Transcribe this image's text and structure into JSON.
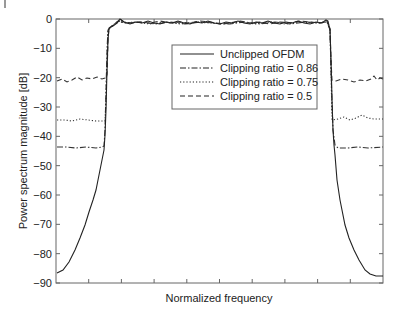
{
  "chart_data": {
    "type": "line",
    "title": "",
    "xlabel": "Normalized frequency",
    "ylabel": "Power spectrum magnitude [dB]",
    "ylim": [
      -90,
      0
    ],
    "xlim": [
      0,
      1
    ],
    "yticks": [
      0,
      -10,
      -20,
      -30,
      -40,
      -50,
      -60,
      -70,
      -80,
      -90
    ],
    "ytick_labels": [
      "0",
      "−10",
      "−20",
      "−30",
      "−40",
      "−50",
      "−60",
      "−70",
      "−80",
      "−90"
    ],
    "xticks": [
      0.1,
      0.2,
      0.3,
      0.4,
      0.5,
      0.6,
      0.7,
      0.8,
      0.9
    ],
    "xtick_labels_visible": false,
    "grid": false,
    "legend_position": "upper center",
    "series": [
      {
        "name": "Unclipped OFDM",
        "style": "solid",
        "points": [
          [
            0.0,
            -86.5
          ],
          [
            0.02,
            -85.5
          ],
          [
            0.05,
            -79
          ],
          [
            0.09,
            -70
          ],
          [
            0.11,
            -61.5
          ],
          [
            0.13,
            -55
          ],
          [
            0.14,
            -48
          ],
          [
            0.145,
            -45
          ],
          [
            0.155,
            -30
          ],
          [
            0.16,
            -10
          ],
          [
            0.163,
            -3
          ],
          [
            0.17,
            -2.5
          ],
          [
            0.19,
            -1
          ],
          [
            0.2,
            0
          ],
          [
            0.25,
            -1.5
          ],
          [
            0.35,
            -1
          ],
          [
            0.45,
            -1.5
          ],
          [
            0.55,
            -1
          ],
          [
            0.65,
            -1.5
          ],
          [
            0.75,
            -1
          ],
          [
            0.82,
            -0.5
          ],
          [
            0.835,
            -3
          ],
          [
            0.84,
            -10
          ],
          [
            0.845,
            -30
          ],
          [
            0.855,
            -45
          ],
          [
            0.86,
            -55
          ],
          [
            0.87,
            -61.5
          ],
          [
            0.885,
            -70
          ],
          [
            0.915,
            -79
          ],
          [
            0.95,
            -85
          ],
          [
            0.98,
            -87.5
          ],
          [
            1.0,
            -88
          ]
        ]
      },
      {
        "name": "Clipping ratio = 0.86",
        "style": "dashdot",
        "stopband_level_left": -43.5,
        "stopband_level_right": -43.5,
        "passband_level": -1.5
      },
      {
        "name": "Clipping ratio = 0.75",
        "style": "dotted",
        "stopband_level_left": -34.5,
        "stopband_level_right": -34,
        "passband_level": -1.5
      },
      {
        "name": "Clipping ratio = 0.5",
        "style": "dashed",
        "stopband_level_left": -20,
        "stopband_level_right": -20.5,
        "passband_level": -1.5
      }
    ],
    "legend": [
      {
        "label": "Unclipped OFDM",
        "style": "solid"
      },
      {
        "label": "Clipping ratio = 0.86",
        "style": "dashdot"
      },
      {
        "label": "Clipping ratio = 0.75",
        "style": "dotted"
      },
      {
        "label": "Clipping ratio = 0.5",
        "style": "dashed"
      }
    ]
  },
  "colors": {
    "line": "#222222",
    "axis": "#555555",
    "background": "#ffffff"
  }
}
